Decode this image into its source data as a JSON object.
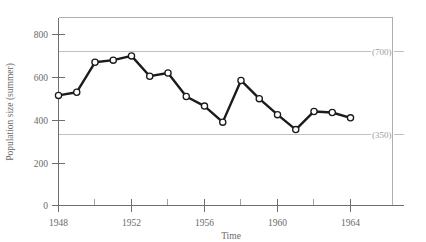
{
  "chart_data": {
    "type": "line",
    "title": "",
    "xlabel": "Time",
    "ylabel": "Population size (summer)",
    "x": [
      1948,
      1949,
      1950,
      1951,
      1952,
      1953,
      1954,
      1955,
      1956,
      1957,
      1958,
      1959,
      1960,
      1961,
      1962,
      1963,
      1964
    ],
    "values": [
      515,
      530,
      670,
      680,
      700,
      605,
      620,
      510,
      465,
      390,
      585,
      500,
      425,
      355,
      440,
      435,
      410
    ],
    "series": [
      {
        "name": "Population size (summer)",
        "values": [
          515,
          530,
          670,
          680,
          700,
          605,
          620,
          510,
          465,
          390,
          585,
          500,
          425,
          355,
          440,
          435,
          410
        ]
      }
    ],
    "xlim": [
      1947.5,
      1965.2
    ],
    "ylim": [
      0,
      880
    ],
    "x_tick_labels": [
      "1948",
      "1952",
      "1956",
      "1960",
      "1964"
    ],
    "x_tick_values": [
      1948,
      1952,
      1956,
      1960,
      1964
    ],
    "x_minor_tick_values": [
      1950,
      1954,
      1958,
      1962
    ],
    "y_tick_labels": [
      "0",
      "200",
      "400",
      "600",
      "800"
    ],
    "y_tick_values": [
      0,
      200,
      400,
      600,
      800
    ],
    "grid": "two horizontal reference lines only",
    "legend": "none",
    "reference_lines": [
      {
        "value": 700,
        "label": "(700)"
      },
      {
        "value": 350,
        "label": "(350)"
      }
    ],
    "marker_style": "open circle",
    "line_color": "#1b1b1b",
    "marker_fill": "#ffffff",
    "reference_line_color": "#b9b9b9",
    "axis_color": "#6e6e6e",
    "background_color": "#ffffff"
  },
  "axis": {
    "y_title": "Population size (summer)",
    "x_title": "Time",
    "y_ticks": [
      {
        "label": "800",
        "value": 800
      },
      {
        "label": "600",
        "value": 600
      },
      {
        "label": "400",
        "value": 400
      },
      {
        "label": "200",
        "value": 200
      },
      {
        "label": "0",
        "value": 0
      }
    ],
    "x_ticks": [
      {
        "label": "1948",
        "value": 1948
      },
      {
        "label": "1952",
        "value": 1952
      },
      {
        "label": "1956",
        "value": 1956
      },
      {
        "label": "1960",
        "value": 1960
      },
      {
        "label": "1964",
        "value": 1964
      }
    ]
  },
  "annotations": {
    "upper_reference_label": "(700)",
    "lower_reference_label": "(350)"
  }
}
